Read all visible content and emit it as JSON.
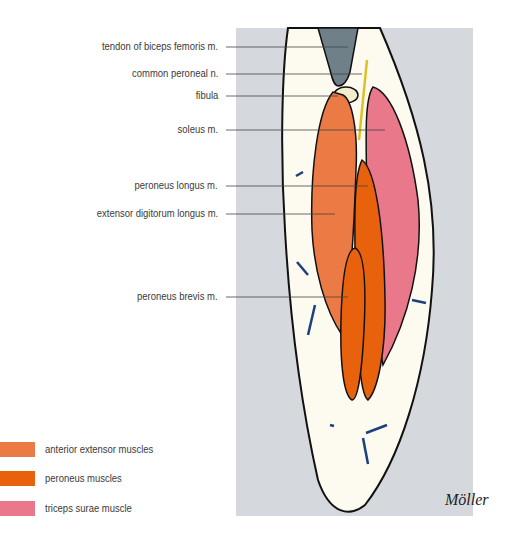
{
  "figure": {
    "background_panel_color": "#d5d8dc",
    "skin_color": "#fdfaf0",
    "signature": "Möller"
  },
  "labels": [
    {
      "text": "tendon of biceps femoris m.",
      "y": 47
    },
    {
      "text": "common peroneal n.",
      "y": 74
    },
    {
      "text": "fibula",
      "y": 96
    },
    {
      "text": "soleus m.",
      "y": 130
    },
    {
      "text": "peroneus longus m.",
      "y": 186
    },
    {
      "text": "extensor digitorum longus m.",
      "y": 214
    },
    {
      "text": "peroneus brevis m.",
      "y": 297
    }
  ],
  "legend": [
    {
      "label": "anterior extensor muscles",
      "color": "#ec7a45"
    },
    {
      "label": "peroneus muscles",
      "color": "#e8620e"
    },
    {
      "label": "triceps surae muscle",
      "color": "#e8788a"
    }
  ]
}
